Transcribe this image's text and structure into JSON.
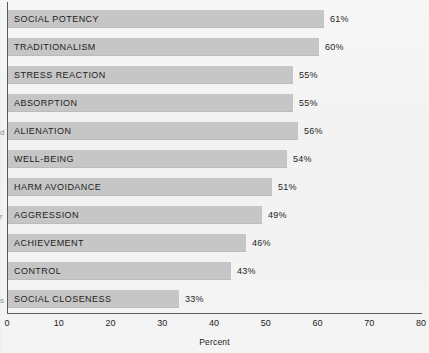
{
  "chart_data": {
    "type": "bar",
    "orientation": "horizontal",
    "title": "",
    "xlabel": "Percent",
    "ylabel": "",
    "xlim": [
      0,
      80
    ],
    "grid": false,
    "legend": null,
    "categories": [
      "SOCIAL POTENCY",
      "TRADITIONALISM",
      "STRESS REACTION",
      "ABSORPTION",
      "ALIENATION",
      "WELL-BEING",
      "HARM AVOIDANCE",
      "AGGRESSION",
      "ACHIEVEMENT",
      "CONTROL",
      "SOCIAL CLOSENESS"
    ],
    "values": [
      61,
      60,
      55,
      55,
      56,
      54,
      51,
      49,
      46,
      43,
      33
    ],
    "value_labels": [
      "61%",
      "60%",
      "55%",
      "55%",
      "56%",
      "54%",
      "51%",
      "49%",
      "46%",
      "43%",
      "33%"
    ],
    "xticks": [
      0,
      10,
      20,
      30,
      40,
      50,
      60,
      70,
      80
    ],
    "xtick_labels": [
      "0",
      "10",
      "20",
      "30",
      "40",
      "50",
      "60",
      "70",
      "80"
    ],
    "bar_color": "#c6c6c6",
    "axis_color": "#5a5a5a",
    "text_color": "#1d1d1d",
    "background_color": "#f3f3f3"
  },
  "margin_glyphs": [
    {
      "text": "d",
      "top": 128
    },
    {
      "text": "r",
      "top": 212
    },
    {
      "text": "s",
      "top": 296
    }
  ]
}
